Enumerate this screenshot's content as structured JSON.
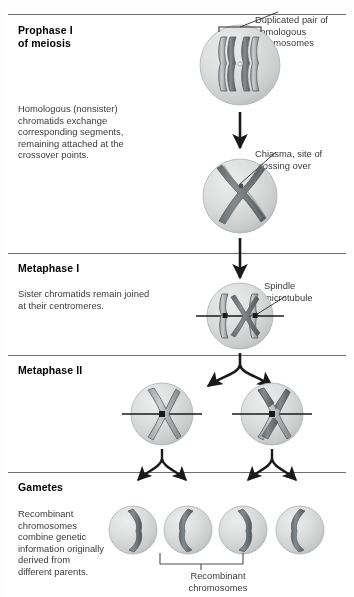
{
  "figure": {
    "sections": [
      {
        "id": "prophase-1",
        "title": "Prophase I\nof meiosis",
        "title_line1": "Prophase I",
        "title_line2": "of meiosis",
        "body": "Homologous (nonsister)\nchromatids exchange\ncorresponding segments,\nremaining attached at the\ncrossover points.",
        "body_lines": [
          "Homologous (nonsister)",
          "chromatids exchange",
          "corresponding segments,",
          "remaining attached at the",
          "crossover points."
        ]
      },
      {
        "id": "metaphase-1",
        "title_line1": "Metaphase I",
        "body_lines": [
          "Sister chromatids remain joined",
          "at their centromeres."
        ]
      },
      {
        "id": "metaphase-2",
        "title_line1": "Metaphase II",
        "body_lines": []
      },
      {
        "id": "gametes",
        "title_line1": "Gametes",
        "body_lines": [
          "Recombinant",
          "chromosomes",
          "combine genetic",
          "information originally",
          "derived from",
          "different parents."
        ]
      }
    ],
    "callouts": [
      {
        "id": "duplicated-pair",
        "lines": [
          "Duplicated pair of",
          "homologous",
          "chromosomes"
        ]
      },
      {
        "id": "chiasma",
        "lines": [
          "Chiasma, site of",
          "crossing over"
        ]
      },
      {
        "id": "spindle-microtubule",
        "lines": [
          "Spindle",
          "microtubule"
        ]
      }
    ],
    "bottom_caption": {
      "id": "recombinant-chromosomes",
      "lines": [
        "Recombinant",
        "chromosomes"
      ]
    },
    "colors": {
      "rule": "#6d6e71",
      "text": "#3a3a3a",
      "title": "#000000",
      "cell_fill": "#d5d6d6",
      "cell_edge": "#a9abab",
      "chromosome_light": "#b9bcbd",
      "chromosome_dark": "#6f7375",
      "chromosome_outline": "#585c5e",
      "arrow": "#1a1a1a",
      "leader": "#2b2b2b"
    }
  }
}
